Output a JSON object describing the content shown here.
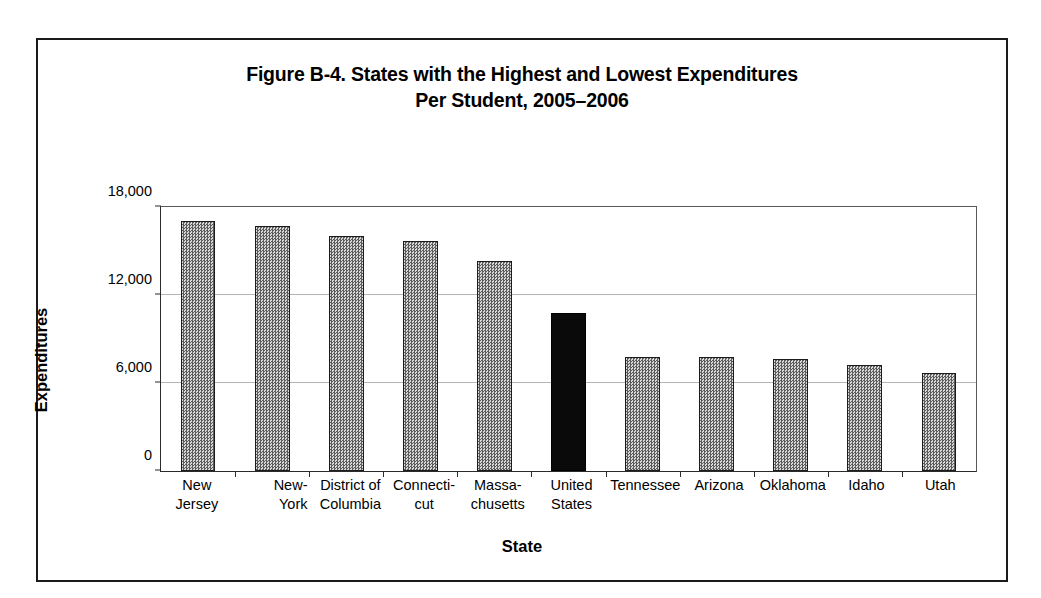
{
  "figure": {
    "title_line1": "Figure B-4. States with the Highest and Lowest Expenditures",
    "title_line2": "Per Student, 2005–2006",
    "x_axis_title": "State",
    "y_axis_title": "Expenditures"
  },
  "chart_data": {
    "type": "bar",
    "title": "Figure B-4. States with the Highest and Lowest Expenditures Per Student, 2005–2006",
    "xlabel": "State",
    "ylabel": "Expenditures",
    "ylim": [
      0,
      18000
    ],
    "yticks": [
      0,
      6000,
      12000,
      18000
    ],
    "ytick_labels": [
      "0",
      "6,000",
      "12,000",
      "18,000"
    ],
    "grid": "horizontal",
    "legend": "none",
    "categories": [
      "New Jersey",
      "New-York",
      "District of Columbia",
      "Connecti-cut",
      "Massa-chusetts",
      "United States",
      "Tennessee",
      "Arizona",
      "Oklahoma",
      "Idaho",
      "Utah"
    ],
    "values": [
      17050,
      16700,
      16000,
      15650,
      14350,
      10800,
      7800,
      7800,
      7650,
      7250,
      6650
    ],
    "highlight_index": 5,
    "highlight_color": "#0a0a0a",
    "bar_color": "#9a9a9a",
    "bar_border_color": "#1c1c1c"
  },
  "x_labels": [
    {
      "line1": "New",
      "line2": "Jersey",
      "align": "center"
    },
    {
      "line1": "New-",
      "line2": "York",
      "align": "right"
    },
    {
      "line1": "District of",
      "line2": "Columbia",
      "align": "center"
    },
    {
      "line1": "Connecti-",
      "line2": "cut",
      "align": "center"
    },
    {
      "line1": "Massa-",
      "line2": "chusetts",
      "align": "center"
    },
    {
      "line1": "United",
      "line2": "States",
      "align": "center"
    },
    {
      "line1": "Tennessee",
      "line2": "",
      "align": "center"
    },
    {
      "line1": "Arizona",
      "line2": "",
      "align": "center"
    },
    {
      "line1": "Oklahoma",
      "line2": "",
      "align": "center"
    },
    {
      "line1": "Idaho",
      "line2": "",
      "align": "center"
    },
    {
      "line1": "Utah",
      "line2": "",
      "align": "center"
    }
  ]
}
